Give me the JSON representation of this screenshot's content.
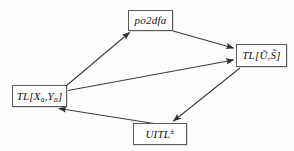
{
  "diagram": {
    "background_color": "#fdfdfd",
    "line_color": "#3c3c3c",
    "box_border_color": "#5a5a5a",
    "nodes": [
      {
        "id": "po2dfa",
        "label": "po2dfa",
        "shape": "rectangle",
        "x": 128,
        "y": 10,
        "w": 45,
        "h": 21
      },
      {
        "id": "tl-us",
        "label": "TL[Ũ,S̃]",
        "label_prefix": "TL",
        "label_open": "[",
        "label_first": "Ũ",
        "label_sep": ",",
        "label_second": "S̃",
        "label_close": "]",
        "shape": "rectangle",
        "x": 236,
        "y": 44,
        "w": 51,
        "h": 23
      },
      {
        "id": "tl-xy",
        "label": "TL[Xa,Ya]",
        "label_prefix": "TL",
        "label_open": "[",
        "label_first": "X",
        "label_first_sub": "a",
        "label_sep": ",",
        "label_second": "Y",
        "label_second_sub": "a",
        "label_close": "]",
        "shape": "rectangle",
        "x": 12,
        "y": 85,
        "w": 55,
        "h": 22
      },
      {
        "id": "uitl",
        "label": "UITL±",
        "label_base": "UITL",
        "label_sup": "±",
        "shape": "rectangle",
        "x": 133,
        "y": 123,
        "w": 54,
        "h": 22
      }
    ],
    "edges": [
      {
        "id": "xy-to-po2dfa",
        "from": "tl-xy",
        "to": "po2dfa",
        "arrowhead": "target",
        "x1": 66,
        "y1": 86,
        "x2": 130,
        "y2": 33
      },
      {
        "id": "po2dfa-to-tl-us",
        "from": "po2dfa",
        "to": "tl-us",
        "arrowhead": "target",
        "x1": 173,
        "y1": 31,
        "x2": 234,
        "y2": 48
      },
      {
        "id": "xy-to-tl-us",
        "from": "tl-xy",
        "to": "tl-us",
        "arrowhead": "target",
        "x1": 68,
        "y1": 90,
        "x2": 234,
        "y2": 60
      },
      {
        "id": "tl-us-to-uitl",
        "from": "tl-us",
        "to": "uitl",
        "arrowhead": "target",
        "x1": 240,
        "y1": 68,
        "x2": 174,
        "y2": 121
      },
      {
        "id": "uitl-to-xy",
        "from": "uitl",
        "to": "tl-xy",
        "arrowhead": "target",
        "x1": 176,
        "y1": 127,
        "x2": 58,
        "y2": 109
      }
    ]
  }
}
